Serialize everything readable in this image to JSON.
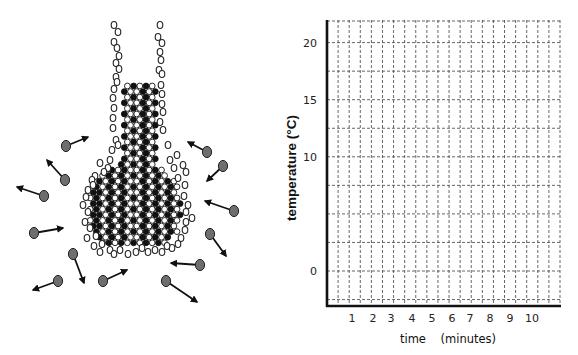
{
  "figure": {
    "left_panel": {
      "title": "Flask diagram: solid lattice in a flask surrounded by moving gas molecules",
      "lattice_color": "#111111",
      "outline_particle_color": "#222222",
      "gas_molecule_color": "#6e6e6e",
      "arrow_color": "#111111"
    },
    "right_panel": {
      "y_axis_title": "temperature (°C)",
      "x_axis_title": "time    (minutes)",
      "grid_color": "#555555",
      "axis_color": "#111111"
    }
  },
  "chart_data": {
    "type": "line",
    "title": "",
    "xlabel": "time (minutes)",
    "ylabel": "temperature (°C)",
    "x_ticks": [
      "1",
      "2",
      "3",
      "4",
      "5",
      "6",
      "7",
      "8",
      "9",
      "10"
    ],
    "y_ticks": [
      "0",
      "10",
      "15",
      "20",
      "25"
    ],
    "xlim": [
      0,
      11.5
    ],
    "ylim": [
      -5,
      27
    ],
    "grid": true,
    "grid_style": "dashed",
    "series": [],
    "note": "Empty graph grid (no data plotted)"
  }
}
